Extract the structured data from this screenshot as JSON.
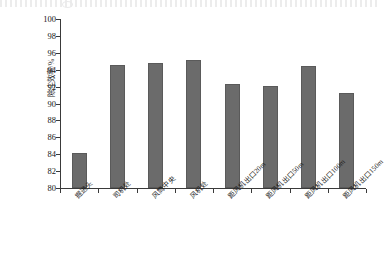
{
  "chart_data": {
    "type": "bar",
    "title": "",
    "xlabel": "",
    "ylabel": "除尘效率/%",
    "ylim": [
      80,
      100
    ],
    "ytick_step": 2,
    "yticks": [
      100,
      98,
      96,
      94,
      92,
      90,
      88,
      86,
      84,
      82,
      80
    ],
    "grid": false,
    "legend": "none",
    "bar_color": "#6b6b6b",
    "bar_edge_color": "#5a5a5a",
    "axis_color": "#3a3a3a",
    "categories": [
      "掘进头",
      "司机处",
      "风筒中央",
      "风机处",
      "距风机出口20m",
      "距风机出口50m",
      "距风机出口100m",
      "距风机出口150m"
    ],
    "values": [
      84.2,
      94.5,
      94.8,
      95.2,
      92.3,
      92.1,
      94.4,
      91.2
    ],
    "series": [
      {
        "name": "除尘效率",
        "values": [
          84.2,
          94.5,
          94.8,
          95.2,
          92.3,
          92.1,
          94.4,
          91.2
        ]
      }
    ]
  }
}
